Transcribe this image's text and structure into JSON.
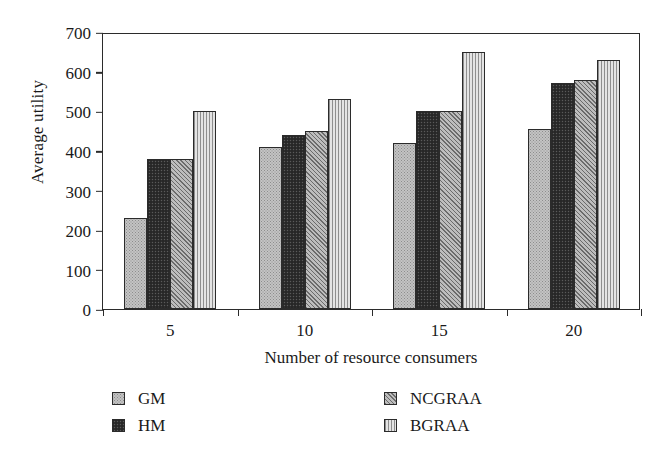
{
  "chart_data": {
    "type": "bar",
    "title": "",
    "xlabel": "Number of resource consumers",
    "ylabel": "Average utility",
    "categories": [
      "5",
      "10",
      "15",
      "20"
    ],
    "series": [
      {
        "name": "GM",
        "values": [
          230,
          410,
          420,
          455
        ],
        "pattern": "dotted-light",
        "color": "#c3c3c3"
      },
      {
        "name": "HM",
        "values": [
          380,
          440,
          500,
          570
        ],
        "pattern": "solid-dark",
        "color": "#2e2e2e"
      },
      {
        "name": "NCGRAA",
        "values": [
          380,
          450,
          500,
          580
        ],
        "pattern": "diagonal-hatch",
        "color": "#9a9a9a"
      },
      {
        "name": "BGRAA",
        "values": [
          500,
          530,
          650,
          630
        ],
        "pattern": "vertical-lines",
        "color": "#d8d8d8"
      }
    ],
    "ylim": [
      0,
      700
    ],
    "yticks": [
      0,
      100,
      200,
      300,
      400,
      500,
      600,
      700
    ],
    "grid": false,
    "legend_position": "bottom",
    "axis_color": "#2b2b2b"
  },
  "axes": {
    "ylabel": "Average utility",
    "xlabel": "Number of resource consumers",
    "yticks": [
      "0",
      "100",
      "200",
      "300",
      "400",
      "500",
      "600",
      "700"
    ],
    "xticks": [
      "5",
      "10",
      "15",
      "20"
    ]
  },
  "legend": {
    "items": [
      {
        "label": "GM"
      },
      {
        "label": "HM"
      },
      {
        "label": "NCGRAA"
      },
      {
        "label": "BGRAA"
      }
    ]
  }
}
